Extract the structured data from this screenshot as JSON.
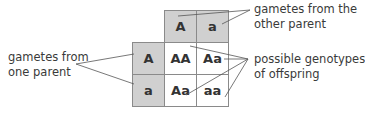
{
  "diagram": {
    "type": "punnett-square",
    "header_gametes": [
      "A",
      "a"
    ],
    "side_gametes": [
      "A",
      "a"
    ],
    "offspring": [
      [
        "AA",
        "Aa"
      ],
      [
        "Aa",
        "aa"
      ]
    ],
    "labels": {
      "other_parent_line1": "gametes from the",
      "other_parent_line2": "other parent",
      "one_parent_line1": "gametes from",
      "one_parent_line2": "one parent",
      "offspring_line1": "possible genotypes",
      "offspring_line2": "of offspring"
    },
    "colors": {
      "gamete_fill": "#d0d0d0",
      "offspring_fill": "#ffffff",
      "border": "#8a8a8a",
      "line": "#555555"
    }
  }
}
